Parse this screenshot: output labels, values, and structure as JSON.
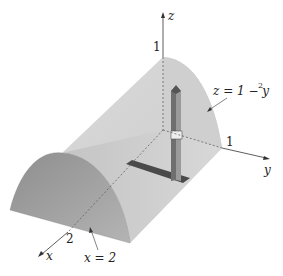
{
  "figure": {
    "type": "3d-solid-region",
    "axes": {
      "x_label": "x",
      "y_label": "y",
      "z_label": "z"
    },
    "ticks": {
      "z_tick": "1",
      "y_tick": "1",
      "x_tick": "2"
    },
    "annotations": {
      "surface_label": "z = 1 − y",
      "surface_exponent": "2",
      "plane_label": "x = 2"
    },
    "colors": {
      "surface_light": "#d9d9d9",
      "surface_mid": "#b8b8b8",
      "front_face": "#a9a9a9",
      "floor": "#c7c7c7",
      "column": "#7a7a7a",
      "strip": "#4a4a4a",
      "axis": "#333333"
    }
  }
}
